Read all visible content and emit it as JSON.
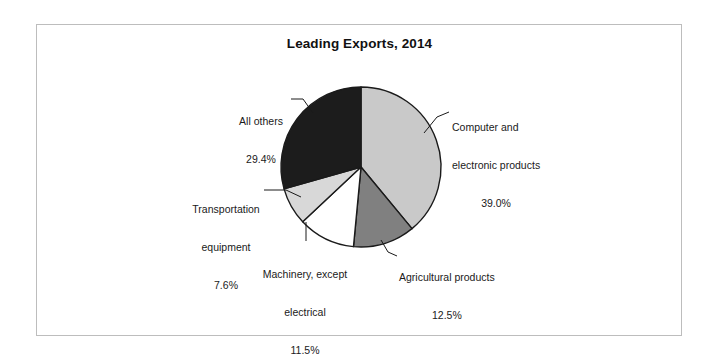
{
  "chart_data": {
    "type": "pie",
    "title": "Leading Exports, 2014",
    "categories": [
      "Computer and electronic products",
      "Agricultural products",
      "Machinery, except electrical",
      "Transportation equipment",
      "All others"
    ],
    "values": [
      39.0,
      12.5,
      11.5,
      7.6,
      29.4
    ],
    "value_labels": [
      "39.0%",
      "12.5%",
      "11.5%",
      "7.6%",
      "29.4%"
    ],
    "units": "percent",
    "start_angle_deg": 0,
    "direction": "clockwise",
    "legend": "none",
    "grid": false,
    "slice_colors": [
      "#c9c9c9",
      "#808080",
      "#ffffff",
      "#d8d8d8",
      "#1c1c1c"
    ],
    "slice_edge_color": "#1a1a1a",
    "labels": [
      {
        "name": "computer",
        "line1": "Computer and",
        "line2": "electronic products",
        "value": "39.0%"
      },
      {
        "name": "agricultural",
        "line1": "Agricultural products",
        "line2": "",
        "value": "12.5%"
      },
      {
        "name": "machinery",
        "line1": "Machinery, except",
        "line2": "electrical",
        "value": "11.5%"
      },
      {
        "name": "transportation",
        "line1": "Transportation",
        "line2": "equipment",
        "value": "7.6%"
      },
      {
        "name": "all-others",
        "line1": "All others",
        "line2": "",
        "value": "29.4%"
      }
    ]
  },
  "figure": {
    "title": "Leading Exports, 2014",
    "frame_color": "#bdbdbd",
    "background": "#ffffff"
  }
}
